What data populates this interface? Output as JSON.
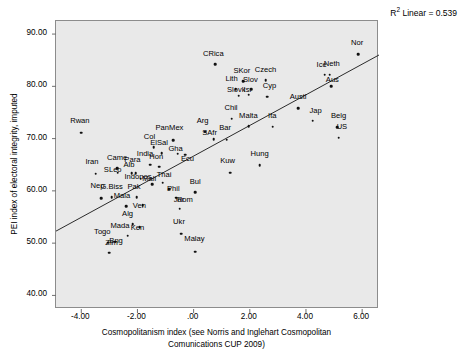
{
  "chart_data": {
    "type": "scatter",
    "title": "",
    "xlabel": "Cosmopolitanism index (see Norris and Inglehart Cosmopolitan Comunications CUP 2009)",
    "xlabel_line1": "Cosmopolitanism index (see Norris and Inglehart Cosmopolitan",
    "xlabel_line2": "Comunications CUP 2009)",
    "ylabel": "PEI index of electoral integrity, imputed",
    "xlim": [
      -4.9,
      6.6
    ],
    "ylim": [
      37.4,
      92.5
    ],
    "xticks": [
      "-4.00",
      "-2.00",
      ".00",
      "2.00",
      "4.00",
      "6.00"
    ],
    "xtick_values": [
      -4,
      -2,
      0,
      2,
      4,
      6
    ],
    "yticks": [
      "90.00",
      "80.00",
      "70.00",
      "60.00",
      "50.00",
      "40.00"
    ],
    "ytick_values": [
      90,
      80,
      70,
      60,
      50,
      40
    ],
    "grid": false,
    "legend": "none",
    "annotation": "R² Linear = 0.539",
    "annotation_prefix": "R",
    "annotation_sup": "2",
    "annotation_suffix": " Linear = 0.539",
    "fit_line": {
      "type": "linear",
      "r_squared": 0.539,
      "x_start": -4.9,
      "y_start": 52.3,
      "x_end": 6.6,
      "y_end": 86.0
    },
    "point_label_key": "country_abbreviation",
    "points": [
      {
        "label": "Rwan",
        "x": -4.0,
        "y": 71.1,
        "lx": -4.05,
        "ly": 72.6
      },
      {
        "label": "Iran",
        "x": -3.48,
        "y": 63.3,
        "lx": -3.62,
        "ly": 64.7
      },
      {
        "label": "Nep",
        "x": -3.3,
        "y": 58.6,
        "lx": -3.42,
        "ly": 60.1
      },
      {
        "label": "Togo",
        "x": -3.04,
        "y": 50.1,
        "lx": -3.25,
        "ly": 51.4
      },
      {
        "label": "Zim",
        "x": -3.0,
        "y": 48.2,
        "lx": -2.92,
        "ly": 49.2
      },
      {
        "label": "Bng",
        "x": -2.8,
        "y": 50.3,
        "lx": -2.76,
        "ly": 49.6
      },
      {
        "label": "G.Biss",
        "x": -2.92,
        "y": 58.8,
        "lx": -2.92,
        "ly": 59.9
      },
      {
        "label": "Came",
        "x": -2.72,
        "y": 64.3,
        "lx": -2.72,
        "ly": 65.6
      },
      {
        "label": "SLeo",
        "x": -2.7,
        "y": 63.5,
        "lx": -2.88,
        "ly": 63.2
      },
      {
        "label": "Mala",
        "x": -2.4,
        "y": 57.1,
        "lx": -2.55,
        "ly": 58.2
      },
      {
        "label": "Mada",
        "x": -2.34,
        "y": 51.4,
        "lx": -2.62,
        "ly": 52.5
      },
      {
        "label": "Alg",
        "x": -2.17,
        "y": 53.6,
        "lx": -2.35,
        "ly": 54.9
      },
      {
        "label": "Alb",
        "x": -2.2,
        "y": 63.4,
        "lx": -2.3,
        "ly": 64.1
      },
      {
        "label": "Para",
        "x": -2.06,
        "y": 63.4,
        "lx": -2.18,
        "ly": 65.2
      },
      {
        "label": "Pak",
        "x": -2.03,
        "y": 58.8,
        "lx": -2.12,
        "ly": 59.9
      },
      {
        "label": "Ken",
        "x": -1.92,
        "y": 53.0,
        "lx": -2.0,
        "ly": 52.2
      },
      {
        "label": "Indones",
        "x": -1.88,
        "y": 62.3,
        "lx": -1.98,
        "ly": 61.9
      },
      {
        "label": "Ven",
        "x": -1.82,
        "y": 57.3,
        "lx": -1.93,
        "ly": 56.3
      },
      {
        "label": "India",
        "x": -1.54,
        "y": 65.0,
        "lx": -1.73,
        "ly": 66.2
      },
      {
        "label": "Mali",
        "x": -1.48,
        "y": 61.3,
        "lx": -1.58,
        "ly": 61.5
      },
      {
        "label": "Col",
        "x": -1.42,
        "y": 68.4,
        "lx": -1.57,
        "ly": 69.6
      },
      {
        "label": "Hon",
        "x": -1.22,
        "y": 64.6,
        "lx": -1.33,
        "ly": 65.8
      },
      {
        "label": "ElSal",
        "x": -1.13,
        "y": 67.2,
        "lx": -1.23,
        "ly": 68.4
      },
      {
        "label": "Thai",
        "x": -1.1,
        "y": 61.6,
        "lx": -1.05,
        "ly": 62.3
      },
      {
        "label": "Phil",
        "x": -0.88,
        "y": 60.3,
        "lx": -0.72,
        "ly": 59.6
      },
      {
        "label": "PanMex",
        "x": -0.72,
        "y": 69.7,
        "lx": -0.86,
        "ly": 71.2
      },
      {
        "label": "Jor",
        "x": -0.63,
        "y": 58.7,
        "lx": -0.52,
        "ly": 57.4
      },
      {
        "label": "Gha",
        "x": -0.56,
        "y": 67.1,
        "lx": -0.64,
        "ly": 67.3
      },
      {
        "label": "Rom",
        "x": -0.5,
        "y": 56.6,
        "lx": -0.31,
        "ly": 57.5
      },
      {
        "label": "Ukr",
        "x": -0.45,
        "y": 51.8,
        "lx": -0.52,
        "ly": 53.2
      },
      {
        "label": "Ecu",
        "x": -0.3,
        "y": 66.9,
        "lx": -0.22,
        "ly": 65.3
      },
      {
        "label": "Bul",
        "x": 0.05,
        "y": 59.7,
        "lx": 0.06,
        "ly": 61.0
      },
      {
        "label": "Malay",
        "x": 0.05,
        "y": 48.4,
        "lx": 0.03,
        "ly": 50.0
      },
      {
        "label": "Arg",
        "x": 0.42,
        "y": 71.3,
        "lx": 0.32,
        "ly": 72.6
      },
      {
        "label": "SAfr",
        "x": 0.72,
        "y": 69.9,
        "lx": 0.57,
        "ly": 70.4
      },
      {
        "label": "CRica",
        "x": 0.77,
        "y": 84.2,
        "lx": 0.7,
        "ly": 85.5
      },
      {
        "label": "Bar",
        "x": 1.18,
        "y": 69.8,
        "lx": 1.12,
        "ly": 71.2
      },
      {
        "label": "Kuw",
        "x": 1.3,
        "y": 63.5,
        "lx": 1.21,
        "ly": 65.0
      },
      {
        "label": "Chil",
        "x": 1.36,
        "y": 73.8,
        "lx": 1.33,
        "ly": 75.1
      },
      {
        "label": "Lith",
        "x": 1.5,
        "y": 79.5,
        "lx": 1.35,
        "ly": 80.6
      },
      {
        "label": "Slovk",
        "x": 1.6,
        "y": 78.2,
        "lx": 1.52,
        "ly": 78.6
      },
      {
        "label": "SKor",
        "x": 1.76,
        "y": 81.0,
        "lx": 1.72,
        "ly": 82.2
      },
      {
        "label": "Isr",
        "x": 1.96,
        "y": 78.4,
        "lx": 1.93,
        "ly": 78.5
      },
      {
        "label": "Malta",
        "x": 1.96,
        "y": 72.4,
        "lx": 1.95,
        "ly": 73.6
      },
      {
        "label": "Slov",
        "x": 2.06,
        "y": 79.5,
        "lx": 2.02,
        "ly": 80.5
      },
      {
        "label": "Hung",
        "x": 2.35,
        "y": 64.9,
        "lx": 2.35,
        "ly": 66.3
      },
      {
        "label": "Czech",
        "x": 2.56,
        "y": 81.2,
        "lx": 2.56,
        "ly": 82.4
      },
      {
        "label": "Cyp",
        "x": 2.62,
        "y": 78.0,
        "lx": 2.7,
        "ly": 79.3
      },
      {
        "label": "Ita",
        "x": 2.82,
        "y": 72.3,
        "lx": 2.8,
        "ly": 73.6
      },
      {
        "label": "Austl",
        "x": 3.72,
        "y": 75.8,
        "lx": 3.72,
        "ly": 77.2
      },
      {
        "label": "Jap",
        "x": 4.24,
        "y": 73.4,
        "lx": 4.34,
        "ly": 74.6
      },
      {
        "label": "Ice",
        "x": 4.66,
        "y": 82.2,
        "lx": 4.56,
        "ly": 83.4
      },
      {
        "label": "Neth",
        "x": 4.84,
        "y": 82.2,
        "lx": 4.92,
        "ly": 83.5
      },
      {
        "label": "Aus",
        "x": 4.9,
        "y": 80.0,
        "lx": 4.94,
        "ly": 80.5
      },
      {
        "label": "Belg",
        "x": 5.12,
        "y": 72.2,
        "lx": 5.16,
        "ly": 73.6
      },
      {
        "label": "US",
        "x": 5.16,
        "y": 70.2,
        "lx": 5.28,
        "ly": 71.5
      },
      {
        "label": "Nor",
        "x": 5.85,
        "y": 86.2,
        "lx": 5.82,
        "ly": 87.5
      }
    ]
  },
  "colors": {
    "plot_background": "#e9e9e9",
    "page_background": "#ffffff",
    "marker": "#111111",
    "fit_line": "#2b2b2b",
    "frame_border": "#8c8c8c",
    "text": "#000000"
  }
}
